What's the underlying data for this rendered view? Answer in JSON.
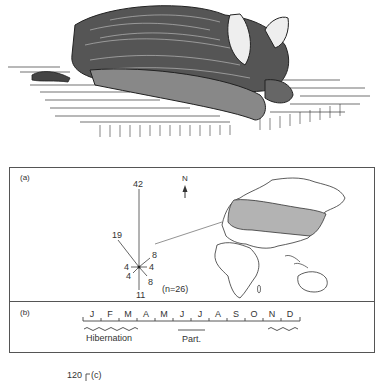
{
  "illustration": {
    "subject": "bat resting on flat surface (pen-and-ink drawing)"
  },
  "panel_a": {
    "label": "(a)",
    "rose": {
      "center": [
        139,
        267
      ],
      "vectors": [
        {
          "direction": "N",
          "count": "42"
        },
        {
          "direction": "NW",
          "count": "19"
        },
        {
          "direction": "NE",
          "count": "8"
        },
        {
          "direction": "E",
          "count": "4"
        },
        {
          "direction": "W",
          "count": "4"
        },
        {
          "direction": "SW",
          "count": "4"
        },
        {
          "direction": "SE",
          "count": "8"
        },
        {
          "direction": "S",
          "count": "11"
        }
      ],
      "n_label": "(n=26)"
    },
    "north_label": "N",
    "map": {
      "description": "Eurasia with shaded distribution band; Africa and Australia outlined",
      "shade_color": "#b3b3b3"
    }
  },
  "panel_b": {
    "label": "(b)",
    "months": [
      "J",
      "F",
      "M",
      "A",
      "M",
      "J",
      "J",
      "A",
      "S",
      "O",
      "N",
      "D"
    ],
    "hibernation_label": "Hibernation",
    "part_label": "Part."
  },
  "panel_c": {
    "label": "(c)",
    "axis_top": "120"
  }
}
